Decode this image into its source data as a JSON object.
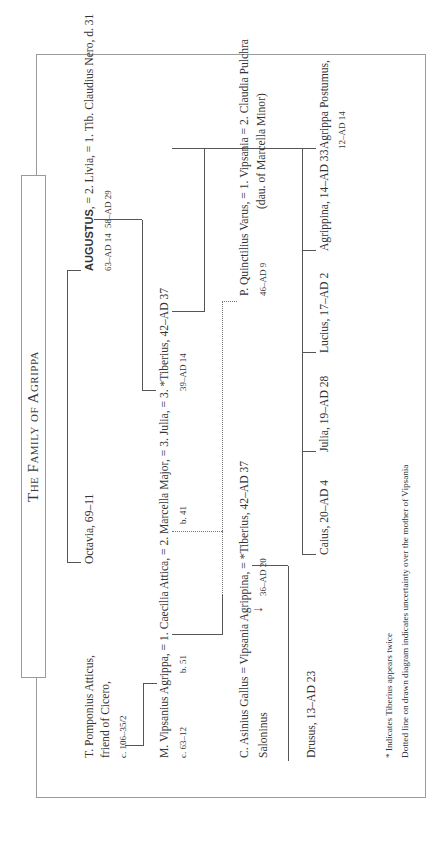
{
  "title": "The Family of Agrippa",
  "people": {
    "atticus": {
      "name": "T. Pomponius Atticus,",
      "line2": "friend of Cicero,",
      "dates": "c. 106–35/2"
    },
    "octavia": {
      "name": "Octavia, 69–11"
    },
    "augustus": {
      "name": "AUGUSTUS",
      "suffix": ", = 2. Livia, = 1. Tib. Claudius Nero, d. 31",
      "dates": "63–AD 14",
      "livia_dates": "58–AD 29"
    },
    "agrippa": {
      "name": "M. Vipsanius Agrippa, = 1. Caecilia Attica, = 2. Marcella Major, = 3. Julia, = 3. *Tiberius, 42–AD 37",
      "dates": "c. 63–12",
      "attica_dates": "b. 51",
      "marcella_dates": "b. 41",
      "julia_dates": "39–AD 14"
    },
    "gallus": {
      "name": "C. Asinius Gallus = Vipsania Agrippina, = *Tiberius, 42–AD 37",
      "line2": "Salonimus",
      "vipsania_dates": "36–AD 20"
    },
    "varus": {
      "name": "P. Quinctilius Varus, = 1. Vipsania = 2. Claudia Pulchra",
      "dates": "46–AD 9",
      "pulchra_note": "(dau. of Marcella Minor)"
    },
    "drusus": {
      "name": "Drusus, 13–AD 23"
    },
    "children": [
      {
        "name": "Caius, 20–AD 4"
      },
      {
        "name": "Julia, 19–AD 28"
      },
      {
        "name": "Lucius, 17–AD 2"
      },
      {
        "name": "Agrippina, 14–AD 33"
      },
      {
        "name": "Agrippa Postumus,",
        "dates": "12–AD 14"
      }
    ]
  },
  "labels": {
    "atticus_name": "T. Pomponius Atticus,",
    "atticus_line2": "friend of Cicero,",
    "atticus_dates": "c. 106–35/2",
    "octavia": "Octavia, 69–11",
    "augustus_name": "AUGUSTUS",
    "augustus_rest": ", = 2. Livia, = 1. Tib. Claudius Nero, d. 31",
    "augustus_dates": "63–AD 14",
    "livia_dates": "58–AD 29",
    "agrippa_line": "M. Vipsanius Agrippa, = 1. Caecilia Attica, = 2. Marcella Major, = 3. Julia, = 3. *Tiberius, 42–AD 37",
    "agrippa_dates": "c. 63–12",
    "attica_dates": "b. 51",
    "marcella_dates": "b. 41",
    "julia_dates": "39–AD 14",
    "gallus_line": "C. Asinius Gallus = Vipsania Agrippina, = *Tiberius, 42–AD 37",
    "gallus_line2": "Saloninus",
    "vipsania_dates": "36–AD 20",
    "varus_line": "P. Quinctilius Varus, = 1. Vipsania = 2. Claudia Pulchra",
    "varus_dates": "46–AD 9",
    "pulchra_note": "(dau. of Marcella Minor)",
    "drusus": "Drusus, 13–AD 23",
    "caius": "Caius, 20–AD 4",
    "julia_child": "Julia, 19–AD 28",
    "lucius": "Lucius, 17–AD 2",
    "agrippina": "Agrippina, 14–AD 33",
    "postumus": "Agrippa Postumus,",
    "postumus_dates": "12–AD 14"
  },
  "notes": [
    "* Indicates Tiberius appears twice",
    "Dotted line on drawn diagram indicates uncertainty over the mother of Vipsania"
  ]
}
